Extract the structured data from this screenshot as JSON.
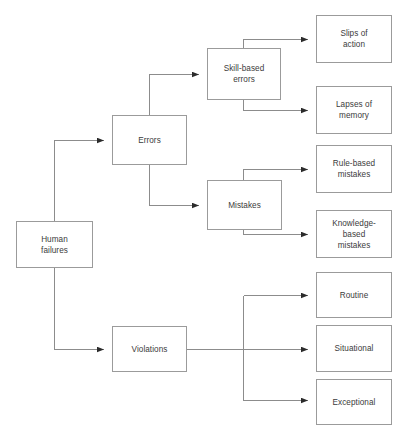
{
  "diagram": {
    "type": "tree-flowchart",
    "orientation": "left-to-right",
    "style": {
      "box_border_color": "#9b9b9b",
      "box_fill_color": "#ffffff",
      "line_color": "#8c8c8c",
      "text_color": "#3b3b3b",
      "background_color": "#ffffff",
      "arrowhead": "solid-triangle"
    },
    "nodes": [
      {
        "id": "human-failures",
        "label": "Human\nfailures",
        "level": 0,
        "x": 16,
        "y": 221,
        "w": 77,
        "h": 47
      },
      {
        "id": "errors",
        "label": "Errors",
        "level": 1,
        "x": 112,
        "y": 115,
        "w": 75,
        "h": 50
      },
      {
        "id": "violations",
        "label": "Violations",
        "level": 1,
        "x": 112,
        "y": 326,
        "w": 75,
        "h": 46
      },
      {
        "id": "skill-based-errors",
        "label": "Skill-based\nerrors",
        "level": 2,
        "x": 207,
        "y": 48,
        "w": 74,
        "h": 52
      },
      {
        "id": "mistakes",
        "label": "Mistakes",
        "level": 2,
        "x": 207,
        "y": 180,
        "w": 75,
        "h": 50
      },
      {
        "id": "slips-of-action",
        "label": "Slips of\naction",
        "level": 3,
        "x": 316,
        "y": 15,
        "w": 76,
        "h": 48
      },
      {
        "id": "lapses-of-memory",
        "label": "Lapses of\nmemory",
        "level": 3,
        "x": 316,
        "y": 86,
        "w": 76,
        "h": 48
      },
      {
        "id": "rule-based-mistakes",
        "label": "Rule-based\nmistakes",
        "level": 3,
        "x": 316,
        "y": 145,
        "w": 76,
        "h": 48
      },
      {
        "id": "knowledge-based-mistakes",
        "label": "Knowledge-\nbased\nmistakes",
        "level": 3,
        "x": 316,
        "y": 210,
        "w": 76,
        "h": 48
      },
      {
        "id": "routine",
        "label": "Routine",
        "level": 3,
        "x": 316,
        "y": 272,
        "w": 76,
        "h": 46
      },
      {
        "id": "situational",
        "label": "Situational",
        "level": 3,
        "x": 316,
        "y": 325,
        "w": 76,
        "h": 47
      },
      {
        "id": "exceptional",
        "label": "Exceptional",
        "level": 3,
        "x": 316,
        "y": 379,
        "w": 76,
        "h": 46
      }
    ],
    "edges": [
      {
        "from": "human-failures",
        "to": "errors"
      },
      {
        "from": "human-failures",
        "to": "violations"
      },
      {
        "from": "errors",
        "to": "skill-based-errors"
      },
      {
        "from": "errors",
        "to": "mistakes"
      },
      {
        "from": "skill-based-errors",
        "to": "slips-of-action"
      },
      {
        "from": "skill-based-errors",
        "to": "lapses-of-memory"
      },
      {
        "from": "mistakes",
        "to": "rule-based-mistakes"
      },
      {
        "from": "mistakes",
        "to": "knowledge-based-mistakes"
      },
      {
        "from": "violations",
        "to": "routine"
      },
      {
        "from": "violations",
        "to": "situational"
      },
      {
        "from": "violations",
        "to": "exceptional"
      }
    ]
  }
}
